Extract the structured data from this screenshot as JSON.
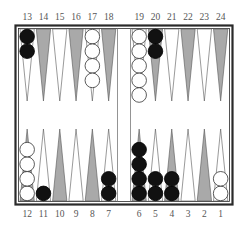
{
  "colors": {
    "frame": "#2a2a2a",
    "board_bg": "#ffffff",
    "point_gray": "#a9a9a9",
    "point_white": "#ffffff",
    "point_outline": "#555555",
    "black_checker": "#111111",
    "white_checker": "#ffffff",
    "checker_outline": "#333333",
    "label": "#555555"
  },
  "top_labels": [
    "13",
    "14",
    "15",
    "16",
    "17",
    "18",
    "19",
    "20",
    "21",
    "22",
    "23",
    "24"
  ],
  "bottom_labels": [
    "12",
    "11",
    "10",
    "9",
    "8",
    "7",
    "6",
    "5",
    "4",
    "3",
    "2",
    "1"
  ],
  "points": [
    {
      "point": 13,
      "row": "top",
      "col": 0,
      "shade": "white",
      "checkers": {
        "color": "black",
        "count": 2
      }
    },
    {
      "point": 14,
      "row": "top",
      "col": 1,
      "shade": "gray",
      "checkers": {
        "color": "none",
        "count": 0
      }
    },
    {
      "point": 15,
      "row": "top",
      "col": 2,
      "shade": "white",
      "checkers": {
        "color": "none",
        "count": 0
      }
    },
    {
      "point": 16,
      "row": "top",
      "col": 3,
      "shade": "gray",
      "checkers": {
        "color": "none",
        "count": 0
      }
    },
    {
      "point": 17,
      "row": "top",
      "col": 4,
      "shade": "white",
      "checkers": {
        "color": "white",
        "count": 4
      }
    },
    {
      "point": 18,
      "row": "top",
      "col": 5,
      "shade": "gray",
      "checkers": {
        "color": "none",
        "count": 0
      }
    },
    {
      "point": 19,
      "row": "top",
      "col": 6,
      "shade": "white",
      "checkers": {
        "color": "white",
        "count": 5
      }
    },
    {
      "point": 20,
      "row": "top",
      "col": 7,
      "shade": "gray",
      "checkers": {
        "color": "black",
        "count": 2
      }
    },
    {
      "point": 21,
      "row": "top",
      "col": 8,
      "shade": "white",
      "checkers": {
        "color": "none",
        "count": 0
      }
    },
    {
      "point": 22,
      "row": "top",
      "col": 9,
      "shade": "gray",
      "checkers": {
        "color": "none",
        "count": 0
      }
    },
    {
      "point": 23,
      "row": "top",
      "col": 10,
      "shade": "white",
      "checkers": {
        "color": "none",
        "count": 0
      }
    },
    {
      "point": 24,
      "row": "top",
      "col": 11,
      "shade": "gray",
      "checkers": {
        "color": "none",
        "count": 0
      }
    },
    {
      "point": 12,
      "row": "bottom",
      "col": 0,
      "shade": "gray",
      "checkers": {
        "color": "white",
        "count": 4
      }
    },
    {
      "point": 11,
      "row": "bottom",
      "col": 1,
      "shade": "white",
      "checkers": {
        "color": "black",
        "count": 1
      }
    },
    {
      "point": 10,
      "row": "bottom",
      "col": 2,
      "shade": "gray",
      "checkers": {
        "color": "none",
        "count": 0
      }
    },
    {
      "point": 9,
      "row": "bottom",
      "col": 3,
      "shade": "white",
      "checkers": {
        "color": "none",
        "count": 0
      }
    },
    {
      "point": 8,
      "row": "bottom",
      "col": 4,
      "shade": "gray",
      "checkers": {
        "color": "none",
        "count": 0
      }
    },
    {
      "point": 7,
      "row": "bottom",
      "col": 5,
      "shade": "white",
      "checkers": {
        "color": "black",
        "count": 2
      }
    },
    {
      "point": 6,
      "row": "bottom",
      "col": 6,
      "shade": "gray",
      "checkers": {
        "color": "black",
        "count": 4
      }
    },
    {
      "point": 5,
      "row": "bottom",
      "col": 7,
      "shade": "white",
      "checkers": {
        "color": "black",
        "count": 2
      }
    },
    {
      "point": 4,
      "row": "bottom",
      "col": 8,
      "shade": "gray",
      "checkers": {
        "color": "black",
        "count": 2
      }
    },
    {
      "point": 3,
      "row": "bottom",
      "col": 9,
      "shade": "white",
      "checkers": {
        "color": "none",
        "count": 0
      }
    },
    {
      "point": 2,
      "row": "bottom",
      "col": 10,
      "shade": "gray",
      "checkers": {
        "color": "none",
        "count": 0
      }
    },
    {
      "point": 1,
      "row": "bottom",
      "col": 11,
      "shade": "white",
      "checkers": {
        "color": "white",
        "count": 2
      }
    }
  ],
  "summary": {
    "black_checkers": 15,
    "white_checkers": 15
  }
}
